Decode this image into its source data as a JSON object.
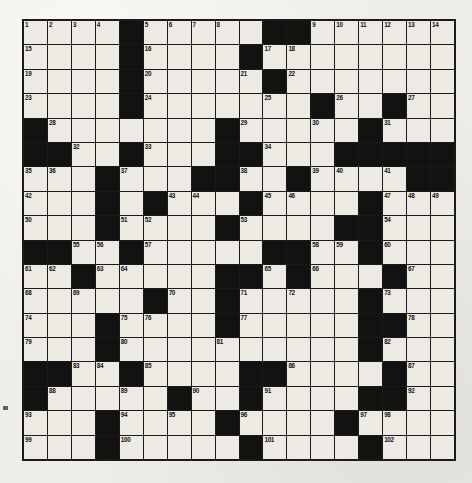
{
  "puzzle": {
    "title": "Crossword Grid",
    "rows": 18,
    "columns": 18,
    "colors": {
      "paper": "#efeee9",
      "cell_fill": "#eceae3",
      "block_fill": "#121210",
      "grid_line": "#1a1a18",
      "number_text": "#111111"
    },
    "max_clue_number": 109,
    "grid": [
      "....#.....##......",
      "....#....#........",
      "....#.....#.......",
      "....#.......#..#..",
      "#.......#.....#...",
      "##..#...##...#####",
      "...#...##..#....##",
      "...#.#...#....#...",
      "...#....#....##...",
      "##..#.....##..#...",
      "..#.....##.#...#..",
      ".....#..#.....#...",
      "...#....#.....##..",
      "...#..........#...",
      "##..#....##....#..",
      "#.....#..#....##..",
      "...#....#....#....",
      "...#.....#....#..."
    ],
    "numbers": [
      {
        "n": 1,
        "r": 0,
        "c": 0
      },
      {
        "n": 2,
        "r": 0,
        "c": 1
      },
      {
        "n": 3,
        "r": 0,
        "c": 2
      },
      {
        "n": 4,
        "r": 0,
        "c": 3
      },
      {
        "n": 5,
        "r": 0,
        "c": 5
      },
      {
        "n": 6,
        "r": 0,
        "c": 6
      },
      {
        "n": 7,
        "r": 0,
        "c": 7
      },
      {
        "n": 8,
        "r": 0,
        "c": 8
      },
      {
        "n": 9,
        "r": 0,
        "c": 9
      },
      {
        "n": 10,
        "r": 0,
        "c": 12
      },
      {
        "n": 11,
        "r": 0,
        "c": 13
      },
      {
        "n": 12,
        "r": 0,
        "c": 14
      },
      {
        "n": 13,
        "r": 0,
        "c": 15
      },
      {
        "n": 14,
        "r": 0,
        "c": 16
      },
      {
        "n": 15,
        "r": 0,
        "c": 18
      },
      {
        "n": 16,
        "r": 0,
        "c": 19
      },
      {
        "n": 17,
        "r": 0,
        "c": 20
      },
      {
        "n": 18,
        "r": 1,
        "c": 0
      },
      {
        "n": 19,
        "r": 1,
        "c": 5
      },
      {
        "n": 20,
        "r": 1,
        "c": 10
      },
      {
        "n": 21,
        "r": 1,
        "c": 18
      },
      {
        "n": 22,
        "r": 2,
        "c": 0
      },
      {
        "n": 23,
        "r": 2,
        "c": 5
      },
      {
        "n": 24,
        "r": 2,
        "c": 11
      },
      {
        "n": 25,
        "r": 2,
        "c": 18
      },
      {
        "n": 26,
        "r": 3,
        "c": 0
      },
      {
        "n": 27,
        "r": 3,
        "c": 4
      },
      {
        "n": 28,
        "r": 3,
        "c": 10
      },
      {
        "n": 29,
        "r": 3,
        "c": 15
      },
      {
        "n": 30,
        "r": 3,
        "c": 16
      },
      {
        "n": 31,
        "r": 4,
        "c": 1
      },
      {
        "n": 32,
        "r": 4,
        "c": 9
      },
      {
        "n": 33,
        "r": 4,
        "c": 14
      },
      {
        "n": 34,
        "r": 5,
        "c": 4
      },
      {
        "n": 35,
        "r": 5,
        "c": 8
      },
      {
        "n": 36,
        "r": 5,
        "c": 13
      },
      {
        "n": 37,
        "r": 6,
        "c": 0
      },
      {
        "n": 38,
        "r": 6,
        "c": 1
      },
      {
        "n": 39,
        "r": 6,
        "c": 2
      },
      {
        "n": 40,
        "r": 6,
        "c": 7
      },
      {
        "n": 41,
        "r": 6,
        "c": 8
      },
      {
        "n": 42,
        "r": 6,
        "c": 13
      },
      {
        "n": 43,
        "r": 7,
        "c": 0
      },
      {
        "n": 44,
        "r": 7,
        "c": 5
      },
      {
        "n": 45,
        "r": 7,
        "c": 6
      },
      {
        "n": 46,
        "r": 7,
        "c": 11
      },
      {
        "n": 47,
        "r": 7,
        "c": 12
      },
      {
        "n": 48,
        "r": 7,
        "c": 16
      },
      {
        "n": 49,
        "r": 7,
        "c": 17
      },
      {
        "n": 50,
        "r": 7,
        "c": 18
      },
      {
        "n": 51,
        "r": 8,
        "c": 0
      },
      {
        "n": 52,
        "r": 8,
        "c": 4
      },
      {
        "n": 53,
        "r": 8,
        "c": 11
      },
      {
        "n": 54,
        "r": 8,
        "c": 15
      },
      {
        "n": 55,
        "r": 9,
        "c": 2
      },
      {
        "n": 56,
        "r": 9,
        "c": 10
      },
      {
        "n": 57,
        "r": 9,
        "c": 11
      },
      {
        "n": 58,
        "r": 9,
        "c": 15
      },
      {
        "n": 59,
        "r": 10,
        "c": 0
      },
      {
        "n": 60,
        "r": 10,
        "c": 1
      },
      {
        "n": 61,
        "r": 10,
        "c": 8
      },
      {
        "n": 62,
        "r": 10,
        "c": 14
      },
      {
        "n": 63,
        "r": 11,
        "c": 0
      },
      {
        "n": 64,
        "r": 11,
        "c": 6
      },
      {
        "n": 65,
        "r": 11,
        "c": 7
      },
      {
        "n": 66,
        "r": 11,
        "c": 12
      },
      {
        "n": 67,
        "r": 11,
        "c": 13
      },
      {
        "n": 68,
        "r": 12,
        "c": 0
      },
      {
        "n": 69,
        "r": 12,
        "c": 5
      },
      {
        "n": 70,
        "r": 12,
        "c": 11
      },
      {
        "n": 71,
        "r": 12,
        "c": 17
      },
      {
        "n": 72,
        "r": 12,
        "c": 18
      },
      {
        "n": 73,
        "r": 13,
        "c": 0
      },
      {
        "n": 74,
        "r": 13,
        "c": 4
      },
      {
        "n": 75,
        "r": 13,
        "c": 10
      },
      {
        "n": 76,
        "r": 13,
        "c": 11
      },
      {
        "n": 77,
        "r": 13,
        "c": 16
      },
      {
        "n": 78,
        "r": 14,
        "c": 2
      },
      {
        "n": 79,
        "r": 14,
        "c": 3
      },
      {
        "n": 80,
        "r": 14,
        "c": 10
      },
      {
        "n": 81,
        "r": 14,
        "c": 15
      },
      {
        "n": 82,
        "r": 15,
        "c": 1
      },
      {
        "n": 83,
        "r": 15,
        "c": 8
      },
      {
        "n": 84,
        "r": 15,
        "c": 9
      },
      {
        "n": 85,
        "r": 15,
        "c": 14
      },
      {
        "n": 86,
        "r": 15,
        "c": 15
      },
      {
        "n": 87,
        "r": 16,
        "c": 0
      },
      {
        "n": 88,
        "r": 16,
        "c": 5
      },
      {
        "n": 89,
        "r": 16,
        "c": 11
      },
      {
        "n": 90,
        "r": 16,
        "c": 12
      },
      {
        "n": 91,
        "r": 16,
        "c": 17
      },
      {
        "n": 92,
        "r": 16,
        "c": 18
      },
      {
        "n": 93,
        "r": 17,
        "c": 0
      },
      {
        "n": 94,
        "r": 17,
        "c": 5
      },
      {
        "n": 95,
        "r": 17,
        "c": 11
      },
      {
        "n": 96,
        "r": 17,
        "c": 20
      },
      {
        "n": 97,
        "r": 18,
        "c": 0
      },
      {
        "n": 98,
        "r": 18,
        "c": 4
      },
      {
        "n": 99,
        "r": 18,
        "c": 5
      },
      {
        "n": 100,
        "r": 18,
        "c": 11
      },
      {
        "n": 101,
        "r": 18,
        "c": 16
      },
      {
        "n": 102,
        "r": 19,
        "c": 0
      },
      {
        "n": 103,
        "r": 19,
        "c": 4
      },
      {
        "n": 104,
        "r": 19,
        "c": 11
      },
      {
        "n": 105,
        "r": 19,
        "c": 16
      },
      {
        "n": 106,
        "r": 20,
        "c": 0
      },
      {
        "n": 107,
        "r": 20,
        "c": 4
      },
      {
        "n": 108,
        "r": 20,
        "c": 11
      },
      {
        "n": 109,
        "r": 20,
        "c": 16
      }
    ]
  }
}
